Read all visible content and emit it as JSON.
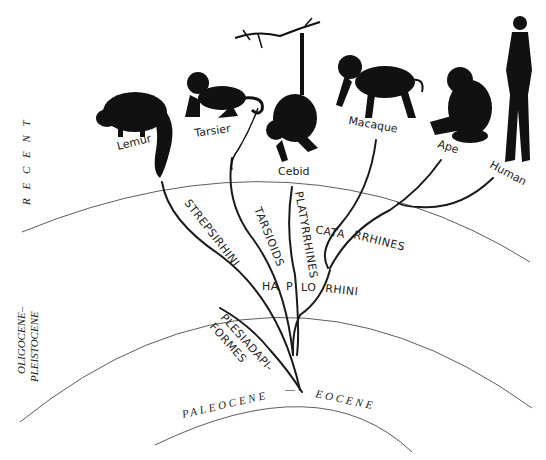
{
  "epochs": {
    "recent": "R E C E N T",
    "oligocene_line1": "OLIGOCENE–",
    "oligocene_line2": "PLEISTOCENE",
    "paleocene": "PALEOCENE",
    "dash": "—",
    "eocene": "EOCENE"
  },
  "taxa": [
    {
      "id": "lemur",
      "label": "Lemur"
    },
    {
      "id": "tarsier",
      "label": "Tarsier"
    },
    {
      "id": "cebid",
      "label": "Cebid"
    },
    {
      "id": "macaque",
      "label": "Macaque"
    },
    {
      "id": "ape",
      "label": "Ape"
    },
    {
      "id": "human",
      "label": "Human"
    }
  ],
  "clades": {
    "strepsirhini": "STREPSIRHINI",
    "tarsioids": "TARSIOIDS",
    "platyrrhines": "PLATYRRHINES",
    "catarrhines_a": "CATA",
    "catarrhines_b": "RRHINES",
    "haplorhini_a": "HA",
    "haplorhini_b": "P",
    "haplorhini_c": "LO",
    "haplorhini_d": "RHINI",
    "plesiadapiformes_line1": "PLESIADAPI-",
    "plesiadapiformes_line2": "FORMES"
  },
  "colors": {
    "ink": "#111111",
    "background": "#ffffff"
  }
}
